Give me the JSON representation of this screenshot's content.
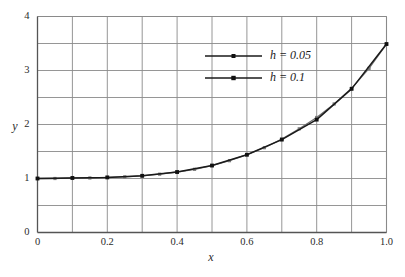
{
  "chart_data": {
    "type": "line",
    "title": "",
    "subtitle": "",
    "xlabel": "x",
    "ylabel": "y",
    "xlim": [
      0,
      1.0
    ],
    "ylim": [
      0,
      4
    ],
    "grid": true,
    "x_major_ticks": [
      "0",
      "0.2",
      "0.4",
      "0.6",
      "0.8",
      "1.0"
    ],
    "x_major_tick_values": [
      0,
      0.2,
      0.4,
      0.6,
      0.8,
      1.0
    ],
    "x_gridline_values": [
      0,
      0.1,
      0.2,
      0.3,
      0.4,
      0.5,
      0.6,
      0.7,
      0.8,
      0.9,
      1.0
    ],
    "y_major_ticks": [
      "0",
      "1",
      "2",
      "3",
      "4"
    ],
    "y_major_tick_values": [
      0,
      1,
      2,
      3,
      4
    ],
    "y_gridline_values": [
      0,
      0.5,
      1,
      1.5,
      2,
      2.5,
      3,
      3.5,
      4
    ],
    "legend_position": "upper-center",
    "marker": "square",
    "line_color": "#1a1a1a",
    "grid_color": "#8a8a8a",
    "axis_color": "#555555",
    "series": [
      {
        "name": "h = 0.05",
        "label_parts": {
          "symbol": "h",
          "relation": "=",
          "value": "0.05"
        },
        "color": "#6e6e6e",
        "marker_color": "#7a7a7a",
        "x": [
          0,
          0.05,
          0.1,
          0.15,
          0.2,
          0.25,
          0.3,
          0.35,
          0.4,
          0.45,
          0.5,
          0.55,
          0.6,
          0.65,
          0.7,
          0.75,
          0.8,
          0.85,
          0.9,
          0.95,
          1.0
        ],
        "values": [
          1.0,
          1.0,
          1.01,
          1.01,
          1.02,
          1.03,
          1.05,
          1.08,
          1.12,
          1.17,
          1.24,
          1.33,
          1.44,
          1.57,
          1.73,
          1.92,
          2.13,
          2.38,
          2.67,
          3.04,
          3.49
        ]
      },
      {
        "name": "h = 0.1",
        "label_parts": {
          "symbol": "h",
          "relation": "=",
          "value": "0.1"
        },
        "color": "#1a1a1a",
        "marker_color": "#111111",
        "x": [
          0,
          0.1,
          0.2,
          0.3,
          0.4,
          0.5,
          0.6,
          0.7,
          0.8,
          0.9,
          1.0
        ],
        "values": [
          1.0,
          1.01,
          1.02,
          1.05,
          1.12,
          1.24,
          1.44,
          1.72,
          2.09,
          2.66,
          3.49
        ]
      }
    ]
  },
  "legend": {
    "entries": [
      {
        "label": "h = 0.05"
      },
      {
        "label": "h = 0.1"
      }
    ]
  },
  "axes": {
    "xlabel": "x",
    "ylabel": "y"
  }
}
